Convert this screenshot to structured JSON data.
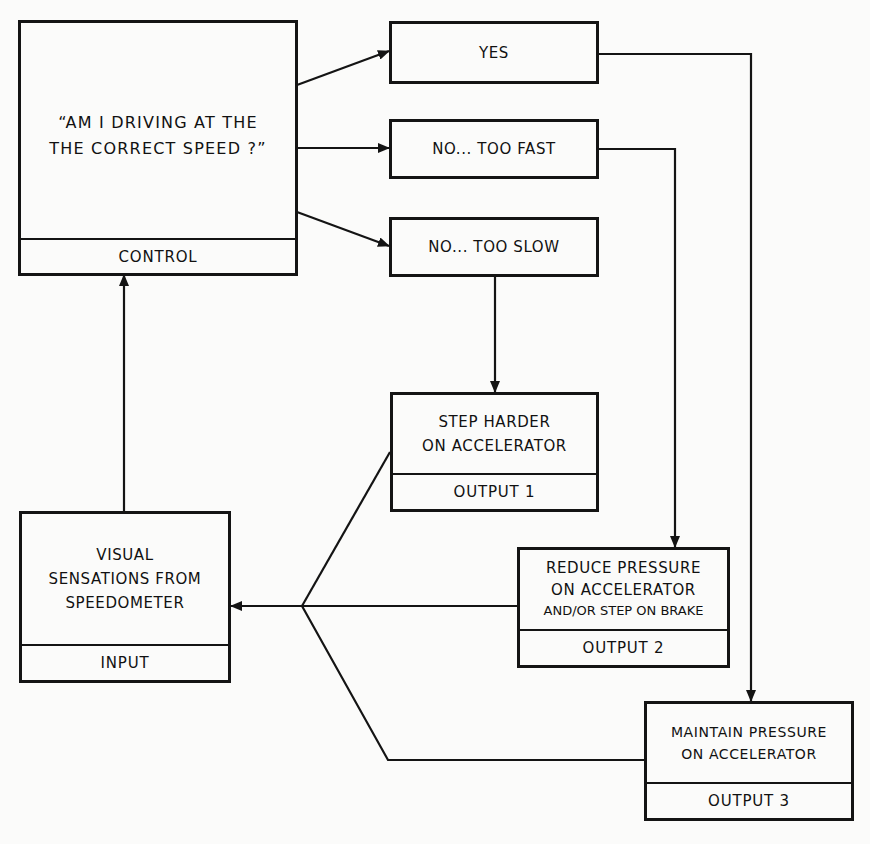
{
  "diagram": {
    "type": "flowchart",
    "stroke_color": "#141414",
    "background_color": "#fbfbfa"
  },
  "nodes": {
    "control": {
      "lines": [
        "“AM I DRIVING AT THE",
        "THE CORRECT SPEED ?”"
      ],
      "footer": "CONTROL"
    },
    "yes": {
      "label": "YES"
    },
    "too_fast": {
      "label": "NO... TOO FAST"
    },
    "too_slow": {
      "label": "NO... TOO SLOW"
    },
    "output1": {
      "lines": [
        "STEP HARDER",
        "ON ACCELERATOR"
      ],
      "footer": "OUTPUT 1"
    },
    "output2": {
      "lines": [
        "REDUCE PRESSURE",
        "ON ACCELERATOR",
        "AND/OR STEP ON BRAKE"
      ],
      "footer": "OUTPUT 2"
    },
    "output3": {
      "lines": [
        "MAINTAIN PRESSURE",
        "ON ACCELERATOR"
      ],
      "footer": "OUTPUT 3"
    },
    "input": {
      "lines": [
        "VISUAL",
        "SENSATIONS FROM",
        "SPEEDOMETER"
      ],
      "footer": "INPUT"
    }
  },
  "edges": [
    {
      "from": "control",
      "to": "yes"
    },
    {
      "from": "control",
      "to": "too_fast"
    },
    {
      "from": "control",
      "to": "too_slow"
    },
    {
      "from": "yes",
      "to": "output3"
    },
    {
      "from": "too_fast",
      "to": "output2"
    },
    {
      "from": "too_slow",
      "to": "output1"
    },
    {
      "from": "output1",
      "to": "input"
    },
    {
      "from": "output2",
      "to": "input"
    },
    {
      "from": "output3",
      "to": "input"
    },
    {
      "from": "input",
      "to": "control"
    }
  ]
}
